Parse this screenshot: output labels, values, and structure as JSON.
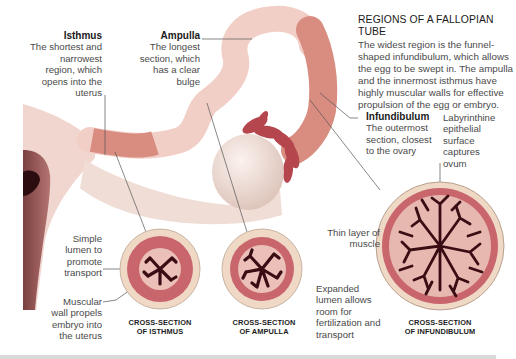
{
  "header": {
    "title": "REGIONS OF A FALLOPIAN TUBE",
    "body": "The widest region is the funnel-shaped infundibulum, which allows the egg to be swept in. The ampulla and the innermost isthmus have highly muscular walls for effective propulsion of the egg or embryo."
  },
  "regions": {
    "isthmus": {
      "name": "Isthmus",
      "desc": "The shortest and narrowest region, which opens into the uterus"
    },
    "ampulla": {
      "name": "Ampulla",
      "desc": "The longest section, which has a clear bulge"
    },
    "infundibulum": {
      "name": "Infundibulum",
      "desc": "The outermost section, closest to the ovary"
    }
  },
  "annotations": {
    "labyrinthine": "Labyrinthine epithelial surface captures ovum",
    "simple_lumen": "Simple lumen to promote transport",
    "muscular_wall": "Muscular wall propels embryo into the uterus",
    "thin_muscle": "Thin layer of muscle",
    "expanded_lumen": "Expanded lumen allows room for fertilization and transport"
  },
  "cross_sections": [
    {
      "line1": "CROSS-SECTION",
      "line2": "OF ISTHMUS"
    },
    {
      "line1": "CROSS-SECTION",
      "line2": "OF AMPULLA"
    },
    {
      "line1": "CROSS-SECTION",
      "line2": "OF INFUNDIBULUM"
    }
  ],
  "colors": {
    "tube_light": "#f2cfc6",
    "tube_dark": "#d98c80",
    "muscle": "#c9666b",
    "outer_ring": "#efd9c4",
    "lumen": "#5a1320",
    "ovary": "#f1e3dc",
    "uterus": "#9a5a5a"
  }
}
